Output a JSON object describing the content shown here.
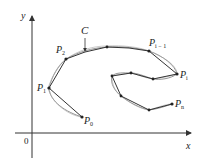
{
  "diagram": {
    "axes": {
      "x_label": "x",
      "y_label": "y",
      "origin_label": "0",
      "color": "#333333"
    },
    "curve": {
      "label": "C",
      "color": "#777777"
    },
    "polygon": {
      "color": "#333333"
    },
    "points": [
      {
        "name": "P0",
        "label": "P",
        "sub": "0"
      },
      {
        "name": "P1",
        "label": "P",
        "sub": "1"
      },
      {
        "name": "P2",
        "label": "P",
        "sub": "2"
      },
      {
        "name": "Pi-1",
        "label": "P",
        "sub": "i − 1"
      },
      {
        "name": "Pi",
        "label": "P",
        "sub": "i"
      },
      {
        "name": "Pn",
        "label": "P",
        "sub": "n"
      }
    ]
  }
}
